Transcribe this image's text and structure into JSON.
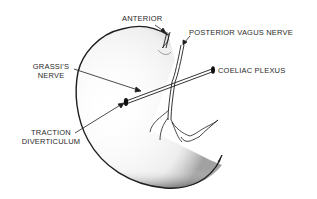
{
  "diagram": {
    "labels": {
      "anterior": "ANTERIOR",
      "posterior_vagus": "POSTERIOR VAGUS NERVE",
      "grassi_line1": "GRASSI'S",
      "grassi_line2": "NERVE",
      "coeliac": "COELIAC PLEXUS",
      "traction_line1": "TRACTION",
      "traction_line2": "DIVERTICULUM"
    },
    "colors": {
      "ink": "#1e1e1e",
      "stipple": "#6a6a6a",
      "background": "#ffffff"
    }
  }
}
